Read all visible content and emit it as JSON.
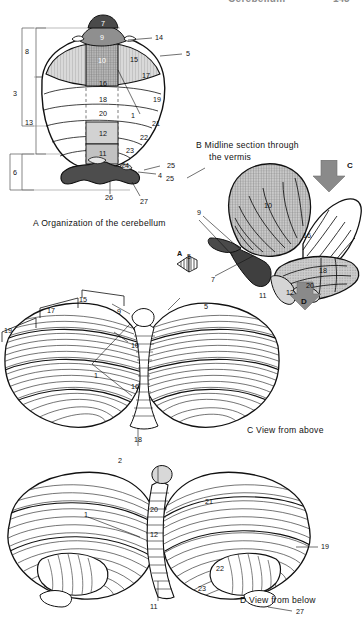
{
  "running_head": {
    "title": "Cerebellum",
    "page_number": "143"
  },
  "panels": [
    {
      "id": "A",
      "letter": "A",
      "caption": "Organization of the cerebellum",
      "caption_full": "A  Organization of the cerebellum",
      "bracket_labels": [
        "8",
        "3",
        "13",
        "6"
      ],
      "labels": [
        "7",
        "9",
        "14",
        "10",
        "15",
        "5",
        "17",
        "16",
        "18",
        "19",
        "20",
        "1",
        "21",
        "12",
        "22",
        "23",
        "11",
        "24",
        "26",
        "4",
        "25",
        "27"
      ]
    },
    {
      "id": "B",
      "letter": "B",
      "caption": "Midline section through the vermis",
      "caption_line1": "B  Midline section through",
      "caption_line2": "the vermis",
      "arrow_labels": [
        "C",
        "D",
        "A"
      ],
      "labels": [
        "10",
        "16",
        "9",
        "7",
        "18",
        "20",
        "11",
        "12",
        "5"
      ]
    },
    {
      "id": "C",
      "letter": "C",
      "caption": "View from above",
      "caption_full": "C  View from above",
      "bracket_labels": [
        "19",
        "17",
        "15"
      ],
      "labels": [
        "9",
        "5",
        "10",
        "1",
        "16",
        "18"
      ]
    },
    {
      "id": "D",
      "letter": "D",
      "caption": "View from below",
      "caption_full": "D  View from below",
      "labels": [
        "2",
        "1",
        "20",
        "12",
        "11",
        "21",
        "19",
        "22",
        "23",
        "27"
      ]
    }
  ],
  "colors": {
    "ink": "#111111",
    "dark_fill": "#4a4a4a",
    "mid_fill": "#9a9a9a",
    "light_fill": "#cfcfcf",
    "pale_fill": "#e6e6e6",
    "white_fill": "#ffffff",
    "head_gray": "#8d8d8d",
    "arrow_gray": "#8a8a8a"
  }
}
